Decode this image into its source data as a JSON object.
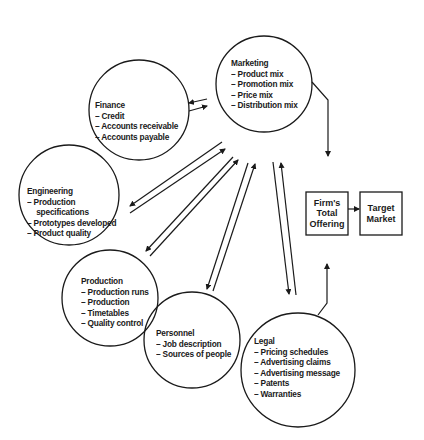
{
  "diagram": {
    "nodes": {
      "marketing": {
        "title": "Marketing",
        "items": [
          "Product mix",
          "Promotion mix",
          "Price mix",
          "Distribution mix"
        ]
      },
      "finance": {
        "title": "Finance",
        "items": [
          "Credit",
          "Accounts receivable",
          "Accounts payable"
        ]
      },
      "engineering": {
        "title": "Engineering",
        "items": [
          "Production",
          "specifications",
          "Prototypes developed",
          "Product quality"
        ]
      },
      "production": {
        "title": "Production",
        "items": [
          "Production runs",
          "Production",
          "Timetables",
          "Quality control"
        ]
      },
      "personnel": {
        "title": "Personnel",
        "items": [
          "Job description",
          "Sources of people"
        ]
      },
      "legal": {
        "title": "Legal",
        "items": [
          "Pricing schedules",
          "Advertising claims",
          "Advertising message",
          "Patents",
          "Warranties"
        ]
      }
    },
    "boxes": {
      "offering": {
        "lines": [
          "Firm's",
          "Total",
          "Offering"
        ]
      },
      "target": {
        "lines": [
          "Target",
          "Market"
        ]
      }
    },
    "colors": {
      "stroke": "#1a1a1a",
      "background": "#ffffff"
    }
  }
}
